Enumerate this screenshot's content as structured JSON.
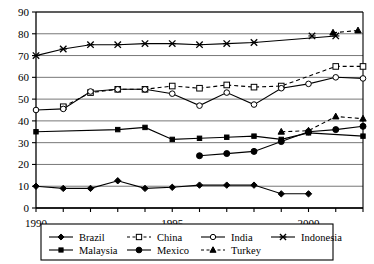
{
  "chart_data": {
    "type": "line",
    "title": "",
    "xlabel": "",
    "ylabel": "",
    "xlim": [
      1990,
      2002
    ],
    "ylim": [
      0,
      90
    ],
    "ytick_step": 10,
    "yticks": [
      0,
      10,
      20,
      30,
      40,
      50,
      60,
      70,
      80,
      90
    ],
    "xticks": [
      1990,
      1991,
      1992,
      1993,
      1994,
      1995,
      1996,
      1997,
      1998,
      1999,
      2000,
      2001,
      2002
    ],
    "xtick_labels_shown": [
      "1990",
      "1995",
      "2000"
    ],
    "grid": "horizontal",
    "legend_position": "bottom",
    "x": [
      1990,
      1991,
      1992,
      1993,
      1994,
      1995,
      1996,
      1997,
      1998,
      1999,
      2000,
      2001,
      2002
    ],
    "series": [
      {
        "name": "Brazil",
        "marker": "filled-diamond",
        "line": "solid",
        "color": "#000000",
        "x": [
          1990,
          1991,
          1992,
          1993,
          1994,
          1995,
          1996,
          1997,
          1998,
          1999,
          2000,
          2001
        ],
        "values": [
          10,
          9,
          9,
          12.5,
          9,
          9.5,
          10.5,
          10.5,
          10.5,
          6.5,
          6.5,
          null
        ]
      },
      {
        "name": "China",
        "marker": "open-square",
        "line": "dashed",
        "color": "#000000",
        "x": [
          1991,
          1992,
          1993,
          1994,
          1995,
          1996,
          1997,
          1998,
          1999,
          2001,
          2002
        ],
        "values": [
          46.5,
          53,
          54.5,
          54.5,
          56,
          55,
          56.5,
          55.5,
          56,
          65,
          65
        ]
      },
      {
        "name": "India",
        "marker": "open-circle",
        "line": "solid",
        "color": "#000000",
        "x": [
          1990,
          1991,
          1992,
          1993,
          1994,
          1995,
          1996,
          1997,
          1998,
          1999,
          2000,
          2001,
          2002
        ],
        "values": [
          45,
          45.5,
          53.5,
          54.5,
          54.5,
          52.5,
          47,
          53,
          47.5,
          55,
          57,
          60,
          59.5
        ]
      },
      {
        "name": "Indonesia",
        "marker": "cross-x",
        "line": "solid",
        "color": "#000000",
        "x": [
          1990,
          1991,
          1992,
          1993,
          1994,
          1995,
          1996,
          1997,
          1998,
          2001
        ],
        "values": [
          70,
          73,
          75,
          75,
          75.5,
          75.5,
          75,
          75.5,
          76,
          79
        ]
      },
      {
        "name": "Malaysia",
        "marker": "small-filled-square",
        "line": "solid",
        "color": "#000000",
        "x": [
          1990,
          1993,
          1994,
          1995,
          1996,
          1997,
          1998,
          1999,
          2000,
          2002
        ],
        "values": [
          35,
          36,
          37,
          31.5,
          32,
          32.5,
          33,
          31.5,
          34.5,
          33
        ]
      },
      {
        "name": "Mexico",
        "marker": "filled-circle",
        "line": "solid",
        "color": "#000000",
        "x": [
          1996,
          1997,
          1998,
          1999,
          2000,
          2001,
          2002
        ],
        "values": [
          24,
          25,
          26,
          30.5,
          35,
          36,
          37.5
        ]
      },
      {
        "name": "Turkey",
        "marker": "filled-triangle",
        "line": "dashed",
        "color": "#000000",
        "x": [
          1999,
          2000,
          2001,
          2002
        ],
        "values": [
          35,
          35.5,
          42,
          41
        ]
      }
    ],
    "extra_points": [
      {
        "series": "Indonesia",
        "x": 2001,
        "y": 79
      },
      {
        "series": "Turkey",
        "x": 2002,
        "y": 80.5
      },
      {
        "series": "Turkey",
        "x": 2003,
        "y": 81
      }
    ]
  },
  "legend": {
    "entries": [
      {
        "label": "Brazil",
        "marker": "filled-diamond",
        "line": "solid"
      },
      {
        "label": "China",
        "marker": "open-square",
        "line": "dashed"
      },
      {
        "label": "India",
        "marker": "open-circle",
        "line": "solid"
      },
      {
        "label": "Indonesia",
        "marker": "cross-x",
        "line": "solid"
      },
      {
        "label": "Malaysia",
        "marker": "small-filled-square",
        "line": "solid"
      },
      {
        "label": "Mexico",
        "marker": "filled-circle",
        "line": "solid"
      },
      {
        "label": "Turkey",
        "marker": "filled-triangle",
        "line": "dashed"
      }
    ]
  },
  "axis": {
    "y_labels": [
      "90",
      "80",
      "70",
      "60",
      "50",
      "40",
      "30",
      "20",
      "10",
      "0"
    ],
    "x_labels": [
      "1990",
      "1995",
      "2000"
    ]
  },
  "colors": {
    "ink": "#000000",
    "grid": "#777777",
    "background": "#ffffff"
  }
}
